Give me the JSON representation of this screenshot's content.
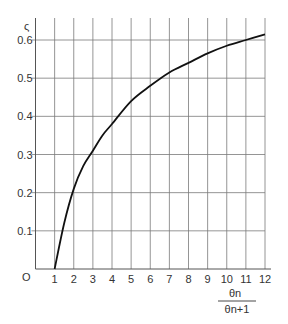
{
  "chart_data": {
    "type": "line",
    "title": "",
    "xlabel_numerator": "θn",
    "xlabel_denominator": "θn+1",
    "xlabel": "θn / θn+1",
    "ylabel": "ς",
    "origin_label": "O",
    "xlim": [
      0,
      12
    ],
    "ylim": [
      0,
      0.6
    ],
    "grid": true,
    "x_ticks": [
      1,
      2,
      3,
      4,
      5,
      6,
      7,
      8,
      9,
      10,
      11,
      12
    ],
    "x_tick_labels": [
      "1",
      "2",
      "3",
      "4",
      "5",
      "6",
      "7",
      "8",
      "9",
      "10",
      "11",
      "12"
    ],
    "y_ticks": [
      0.1,
      0.2,
      0.3,
      0.4,
      0.5,
      0.6
    ],
    "y_tick_labels": [
      "0.1",
      "0.2",
      "0.3",
      "0.4",
      "0.5",
      "0.6"
    ],
    "series": [
      {
        "name": "ς",
        "x": [
          1,
          1.5,
          2,
          2.5,
          3,
          3.5,
          4,
          5,
          6,
          7,
          8,
          9,
          10,
          11,
          12
        ],
        "y": [
          0,
          0.12,
          0.21,
          0.27,
          0.31,
          0.35,
          0.38,
          0.44,
          0.48,
          0.515,
          0.54,
          0.565,
          0.585,
          0.6,
          0.615
        ]
      }
    ]
  }
}
